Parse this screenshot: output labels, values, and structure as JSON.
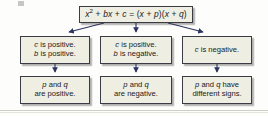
{
  "diagram": {
    "type": "flowchart",
    "colors": {
      "box_fill": "#eeeee3",
      "box_border": "#3b3b45",
      "arrow": "#2c3561",
      "text": "#1a1a22",
      "background": "#fdfdfb"
    },
    "root": {
      "id": "formula",
      "expression_plain": "x2 + bx + c = (x + p)(x + q)",
      "parts": {
        "x": "x",
        "exponent": "2",
        "plus_1": " + ",
        "b": "b",
        "x2": "x",
        "plus_2": " + ",
        "c": "c",
        "equals": " = (",
        "x3": "x",
        "plus_3": " + ",
        "p": "p",
        "close_open": ")(",
        "x4": "x",
        "plus_4": " + ",
        "q": "q",
        "close": ")"
      }
    },
    "branches": [
      {
        "id": "branch-1",
        "condition": {
          "line_1_var": "c",
          "line_1_rest": " is positive.",
          "line_2_var": "b",
          "line_2_rest": " is positive."
        },
        "conclusion": {
          "line_1_var_a": "p",
          "line_1_mid": " and ",
          "line_1_var_b": "q",
          "line_2": "are positive."
        }
      },
      {
        "id": "branch-2",
        "condition": {
          "line_1_var": "c",
          "line_1_rest": " is positive.",
          "line_2_var": "b",
          "line_2_rest": " is negative."
        },
        "conclusion": {
          "line_1_var_a": "p",
          "line_1_mid": " and ",
          "line_1_var_b": "q",
          "line_2": "are negative."
        }
      },
      {
        "id": "branch-3",
        "condition": {
          "line_1_var": "c",
          "line_1_rest": " is negative.",
          "line_2_var": "",
          "line_2_rest": ""
        },
        "conclusion": {
          "line_1_var_a": "p",
          "line_1_mid": " and ",
          "line_1_var_b": "q",
          "line_1_tail": " have",
          "line_2": "different signs."
        }
      }
    ]
  }
}
